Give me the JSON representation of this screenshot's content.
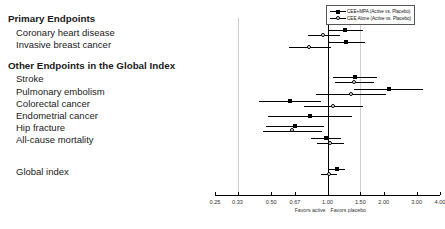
{
  "chart_data": {
    "type": "scatter",
    "plot_style": "forest-plot",
    "title": "",
    "xlabel": "",
    "ylabel": "",
    "xscale": "log",
    "xlim": [
      0.25,
      4.0
    ],
    "grid": true,
    "reference_line": 1.0,
    "tick_labels": [
      "0.25",
      "0.33",
      "0.50",
      "0.67",
      "1.00",
      "1.50",
      "2.00",
      "3.00",
      "4.00"
    ],
    "tick_values": [
      0.25,
      0.33,
      0.5,
      0.67,
      1.0,
      1.5,
      2.0,
      3.0,
      4.0
    ],
    "gridline_values": [
      0.33,
      1.5
    ],
    "axis_annotations": {
      "left": "Favors active",
      "right": "Favors placebo"
    },
    "legend": {
      "position": "top-right",
      "entries": [
        {
          "name": "CEE+MPA (Active vs. Placebo)",
          "marker": "filled-square"
        },
        {
          "name": "CEE Alone (Active vs. Placebo)",
          "marker": "open-circle"
        }
      ]
    },
    "sections": [
      {
        "heading": "Primary Endpoints",
        "rows": [
          {
            "label": "Coronary heart disease",
            "series": [
              {
                "name": "CEE+MPA (Active vs. Placebo)",
                "marker": "filled-square",
                "value": 1.24,
                "low": 1.0,
                "high": 1.54
              },
              {
                "name": "CEE Alone (Active vs. Placebo)",
                "marker": "open-circle",
                "value": 0.95,
                "low": 0.79,
                "high": 1.16
              }
            ]
          },
          {
            "label": "Invasive breast cancer",
            "series": [
              {
                "name": "CEE+MPA (Active vs. Placebo)",
                "marker": "filled-square",
                "value": 1.26,
                "low": 1.0,
                "high": 1.59
              },
              {
                "name": "CEE Alone (Active vs. Placebo)",
                "marker": "open-circle",
                "value": 0.8,
                "low": 0.62,
                "high": 1.04
              }
            ]
          }
        ]
      },
      {
        "heading": "Other Endpoints in the Global Index",
        "rows": [
          {
            "label": "Stroke",
            "series": [
              {
                "name": "CEE+MPA (Active vs. Placebo)",
                "marker": "filled-square",
                "value": 1.41,
                "low": 1.07,
                "high": 1.85
              },
              {
                "name": "CEE Alone (Active vs. Placebo)",
                "marker": "open-circle",
                "value": 1.39,
                "low": 1.1,
                "high": 1.77
              }
            ]
          },
          {
            "label": "Pulmonary embolism",
            "series": [
              {
                "name": "CEE+MPA (Active vs. Placebo)",
                "marker": "filled-square",
                "value": 2.13,
                "low": 1.39,
                "high": 3.25
              },
              {
                "name": "CEE Alone (Active vs. Placebo)",
                "marker": "open-circle",
                "value": 1.34,
                "low": 0.87,
                "high": 2.06
              }
            ]
          },
          {
            "label": "Colorectal cancer",
            "series": [
              {
                "name": "CEE+MPA (Active vs. Placebo)",
                "marker": "filled-square",
                "value": 0.63,
                "low": 0.43,
                "high": 0.92
              },
              {
                "name": "CEE Alone (Active vs. Placebo)",
                "marker": "open-circle",
                "value": 1.08,
                "low": 0.75,
                "high": 1.55
              }
            ]
          },
          {
            "label": "Endometrial cancer",
            "series": [
              {
                "name": "CEE+MPA (Active vs. Placebo)",
                "marker": "filled-square",
                "value": 0.81,
                "low": 0.48,
                "high": 1.36
              }
            ]
          },
          {
            "label": "Hip fracture",
            "series": [
              {
                "name": "CEE+MPA (Active vs. Placebo)",
                "marker": "filled-square",
                "value": 0.67,
                "low": 0.47,
                "high": 0.96
              },
              {
                "name": "CEE Alone (Active vs. Placebo)",
                "marker": "open-circle",
                "value": 0.65,
                "low": 0.45,
                "high": 0.94
              }
            ]
          },
          {
            "label": "All-cause mortality",
            "series": [
              {
                "name": "CEE+MPA (Active vs. Placebo)",
                "marker": "filled-square",
                "value": 0.98,
                "low": 0.82,
                "high": 1.18
              },
              {
                "name": "CEE Alone (Active vs. Placebo)",
                "marker": "open-circle",
                "value": 1.04,
                "low": 0.88,
                "high": 1.22
              }
            ]
          }
        ]
      },
      {
        "heading": "",
        "rows": [
          {
            "label": "Global index",
            "series": [
              {
                "name": "CEE+MPA (Active vs. Placebo)",
                "marker": "filled-square",
                "value": 1.12,
                "low": 1.02,
                "high": 1.24
              },
              {
                "name": "CEE Alone (Active vs. Placebo)",
                "marker": "open-circle",
                "value": 1.02,
                "low": 0.92,
                "high": 1.13
              }
            ]
          }
        ]
      }
    ]
  }
}
